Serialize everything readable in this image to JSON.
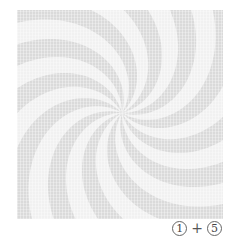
{
  "pattern": {
    "name": "spiral swirl",
    "arms": 12,
    "colors": {
      "dark": "#dadada",
      "light": "#f1f1f1",
      "background": "#ffffff"
    }
  },
  "caption": {
    "left": "1",
    "operator": "+",
    "right": "5"
  }
}
